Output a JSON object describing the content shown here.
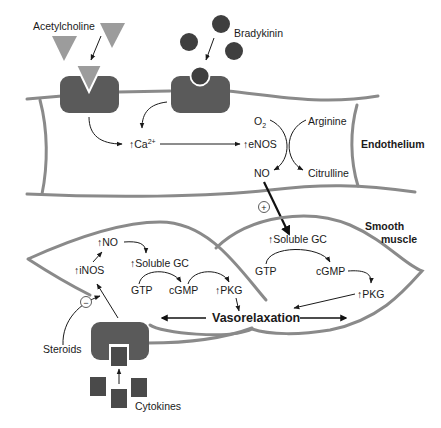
{
  "diagram": {
    "colors": {
      "membrane": "#8a8a8a",
      "receptor": "#5a5a5a",
      "acetylcholine": "#9c9c9c",
      "bradykinin": "#3f3f3f",
      "cytokines": "#4a4a4a",
      "text": "#1a1a1a"
    },
    "ligands": {
      "acetylcholine": "Acetylcholine",
      "bradykinin": "Bradykinin",
      "cytokines": "Cytokines",
      "steroids": "Steroids"
    },
    "endothelium": {
      "label": "Endothelium",
      "calcium": "Ca",
      "calcium_sup": "2+",
      "enos": "eNOS",
      "o2": "O",
      "o2_sub": "2",
      "arginine": "Arginine",
      "no": "NO",
      "citrulline": "Citrulline",
      "up_arrow": "↑"
    },
    "plus_sign": "+",
    "minus_sign": "−",
    "smooth_muscle": {
      "label_line1": "Smooth",
      "label_line2": "muscle",
      "right_cell": {
        "soluble_gc": "Soluble GC",
        "gtp": "GTP",
        "cgmp": "cGMP",
        "pkg": "PKG"
      },
      "left_cell": {
        "no": "NO",
        "inos": "iNOS",
        "soluble_gc": "Soluble GC",
        "gtp": "GTP",
        "cgmp": "cGMP",
        "pkg": "PKG"
      },
      "vasorelaxation": "Vasorelaxation"
    }
  }
}
